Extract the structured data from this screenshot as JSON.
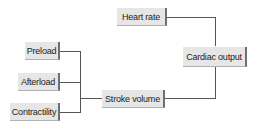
{
  "diagram": {
    "nodes": {
      "heart_rate": "Heart rate",
      "cardiac_output": "Cardiac output",
      "preload": "Preload",
      "afterload": "Afterload",
      "contractility": "Contractility",
      "stroke_volume": "Stroke volume"
    },
    "edges": [
      {
        "from": "Preload",
        "to": "Stroke volume"
      },
      {
        "from": "Afterload",
        "to": "Stroke volume"
      },
      {
        "from": "Contractility",
        "to": "Stroke volume"
      },
      {
        "from": "Heart rate",
        "to": "Cardiac output"
      },
      {
        "from": "Stroke volume",
        "to": "Cardiac output"
      }
    ],
    "colors": {
      "box_fill": "#e6e6e6",
      "box_shadow": "#6f6f6f",
      "line": "#555555"
    }
  }
}
